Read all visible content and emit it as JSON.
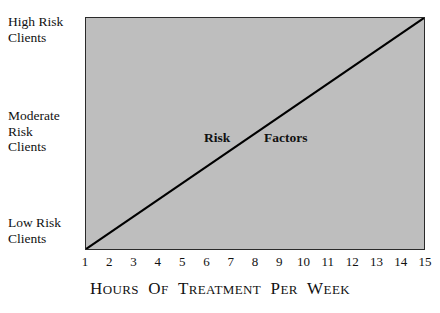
{
  "figure": {
    "background_color": "#ffffff",
    "plot_fill_color": "#bebebe",
    "plot_border_color": "#2a2a2a",
    "line_color": "#000000"
  },
  "y_axis": {
    "labels": [
      {
        "id": "high",
        "text": "High Risk\nClients"
      },
      {
        "id": "moderate",
        "text": "Moderate\nRisk\nClients"
      },
      {
        "id": "low",
        "text": "Low Risk\nClients"
      }
    ]
  },
  "x_axis": {
    "title_words": [
      {
        "first": "H",
        "rest": "OURS"
      },
      {
        "first": "O",
        "rest": "F"
      },
      {
        "first": "T",
        "rest": "REATMENT"
      },
      {
        "first": "P",
        "rest": "ER"
      },
      {
        "first": "W",
        "rest": "EEK"
      }
    ],
    "title_plain": "HOURS OF TREATMENT PER WEEK",
    "ticks": [
      "1",
      "2",
      "3",
      "4",
      "5",
      "6",
      "7",
      "8",
      "9",
      "10",
      "11",
      "12",
      "13",
      "14",
      "15"
    ]
  },
  "annotations": {
    "risk": "Risk",
    "factors": "Factors"
  },
  "chart_data": {
    "type": "line",
    "title": "",
    "subtitle": "",
    "xlabel": "Hours of Treatment per Week",
    "ylabel": "",
    "x": [
      1,
      15
    ],
    "series": [
      {
        "name": "Risk Factors",
        "values": [
          0,
          2
        ],
        "color": "#000000",
        "linewidth": 2,
        "description": "Straight ascending line from the bottom-left corner (1 hour, Low Risk Clients) to the top-right corner (15 hours, High Risk Clients)"
      }
    ],
    "xlim": [
      1,
      15
    ],
    "xticks": [
      1,
      2,
      3,
      4,
      5,
      6,
      7,
      8,
      9,
      10,
      11,
      12,
      13,
      14,
      15
    ],
    "xticklabels": [
      "1",
      "2",
      "3",
      "4",
      "5",
      "6",
      "7",
      "8",
      "9",
      "10",
      "11",
      "12",
      "13",
      "14",
      "15"
    ],
    "ylim": [
      0,
      2
    ],
    "yticks": [
      0,
      1,
      2
    ],
    "yticklabels": [
      "Low Risk Clients",
      "Moderate Risk Clients",
      "High Risk Clients"
    ],
    "grid": false,
    "legend": false,
    "annotations": [
      {
        "text": "Risk",
        "x": 7.0,
        "y": 1.05
      },
      {
        "text": "Factors",
        "x": 9.3,
        "y": 1.05
      }
    ],
    "plot_background": "#bebebe"
  }
}
